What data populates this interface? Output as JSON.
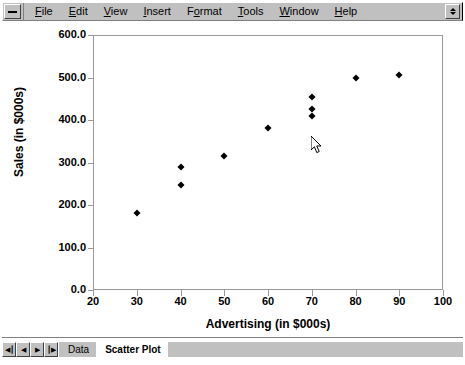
{
  "window": {
    "system_menu_icon": "minimize-box-icon",
    "spinner_icon": "spin-up-down-icon"
  },
  "menubar": {
    "items": [
      {
        "label": "File",
        "mnemonic": "F"
      },
      {
        "label": "Edit",
        "mnemonic": "E"
      },
      {
        "label": "View",
        "mnemonic": "V"
      },
      {
        "label": "Insert",
        "mnemonic": "I"
      },
      {
        "label": "Format",
        "mnemonic": "o"
      },
      {
        "label": "Tools",
        "mnemonic": "T"
      },
      {
        "label": "Window",
        "mnemonic": "W"
      },
      {
        "label": "Help",
        "mnemonic": "H"
      }
    ]
  },
  "chart_data": {
    "type": "scatter",
    "title": "",
    "xlabel": "Advertising (in $000s)",
    "ylabel": "Sales (in $000s)",
    "xlim": [
      20,
      100
    ],
    "ylim": [
      0,
      600
    ],
    "xticks": [
      "20",
      "30",
      "40",
      "50",
      "60",
      "70",
      "80",
      "90",
      "100"
    ],
    "xtick_values": [
      20,
      30,
      40,
      50,
      60,
      70,
      80,
      90,
      100
    ],
    "yticks": [
      "0.0",
      "100.0",
      "200.0",
      "300.0",
      "400.0",
      "500.0",
      "600.0"
    ],
    "ytick_values": [
      0,
      100,
      200,
      300,
      400,
      500,
      600
    ],
    "grid": false,
    "legend": false,
    "marker": "diamond",
    "marker_color": "#000000",
    "points": [
      {
        "x": 30,
        "y": 182
      },
      {
        "x": 40,
        "y": 290
      },
      {
        "x": 40,
        "y": 247
      },
      {
        "x": 50,
        "y": 315
      },
      {
        "x": 60,
        "y": 382
      },
      {
        "x": 70,
        "y": 455
      },
      {
        "x": 70,
        "y": 425
      },
      {
        "x": 70,
        "y": 410
      },
      {
        "x": 80,
        "y": 500
      },
      {
        "x": 90,
        "y": 505
      }
    ]
  },
  "cursor": {
    "icon": "arrow-pointer-icon",
    "x": 313,
    "y": 120
  },
  "tabbar": {
    "nav": [
      {
        "icon": "first-sheet-icon",
        "glyph": "◀┃"
      },
      {
        "icon": "previous-sheet-icon",
        "glyph": "◀"
      },
      {
        "icon": "next-sheet-icon",
        "glyph": "▶"
      },
      {
        "icon": "last-sheet-icon",
        "glyph": "┃▶"
      }
    ],
    "tabs": [
      {
        "label": "Data",
        "active": false
      },
      {
        "label": "Scatter Plot",
        "active": true
      }
    ]
  }
}
